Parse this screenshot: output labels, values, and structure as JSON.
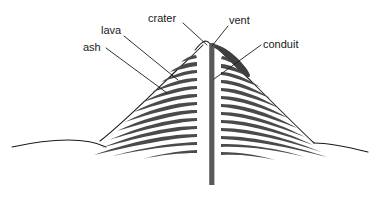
{
  "diagram": {
    "type": "labelled-cross-section-diagram",
    "background_color": "#ffffff",
    "ink_color": "#1a1a1a",
    "lava_fill_color": "#4a4a4a",
    "conduit_fill_color": "#5a5a5a",
    "canvas": {
      "width": 379,
      "height": 197
    },
    "labels": [
      {
        "id": "ash",
        "text": "ash",
        "text_x": 83,
        "text_y": 51,
        "leader_from": {
          "x": 106,
          "y": 48
        },
        "leader_to": {
          "x": 167,
          "y": 93
        }
      },
      {
        "id": "lava",
        "text": "lava",
        "text_x": 101,
        "text_y": 34,
        "leader_from": {
          "x": 124,
          "y": 36
        },
        "leader_to": {
          "x": 178,
          "y": 80
        }
      },
      {
        "id": "crater",
        "text": "crater",
        "text_x": 148,
        "text_y": 22,
        "leader_from": {
          "x": 183,
          "y": 23
        },
        "leader_to": {
          "x": 207,
          "y": 45
        }
      },
      {
        "id": "vent",
        "text": "vent",
        "text_x": 229,
        "text_y": 24,
        "leader_from": {
          "x": 228,
          "y": 26
        },
        "leader_to": {
          "x": 212,
          "y": 46
        }
      },
      {
        "id": "conduit",
        "text": "conduit",
        "text_x": 263,
        "text_y": 48,
        "leader_from": {
          "x": 261,
          "y": 45
        },
        "leader_to": {
          "x": 214,
          "y": 79
        }
      }
    ],
    "geometry": {
      "ground_line": "M 14 146 C 40 141 66 140 92 143 C 118 146 150 148 168 148",
      "ground_line_right": "M 300 145 C 320 144 344 146 366 150",
      "left_slope": "M 104 135 L 205 42",
      "right_slope": "M 216 44 L 312 141",
      "summit_notch": "M 196 48 C 200 44 203 42 206 41 L 211 44",
      "conduit": {
        "x": 209.5,
        "y": 44,
        "width": 5,
        "height": 141
      },
      "dark_wedge": "M 213 45 C 224 47 236 56 248 70 C 250 73 248 75 244 72 C 232 62 221 53 212 49 Z"
    },
    "band_count_left": 13,
    "band_count_right": 13
  }
}
